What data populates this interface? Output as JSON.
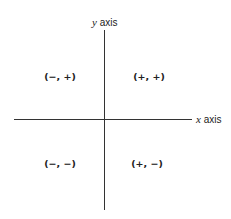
{
  "diagram": {
    "type": "cartesian-quadrants",
    "axes": {
      "x": {
        "variable": "x",
        "label": "axis"
      },
      "y": {
        "variable": "y",
        "label": "axis"
      }
    },
    "quadrants": {
      "top_left": "(−, +)",
      "top_right": "(+, +)",
      "bottom_left": "(−, −)",
      "bottom_right": "(+, −)"
    },
    "colors": {
      "axis": "#333333",
      "text": "#222222",
      "background": "#ffffff"
    }
  }
}
